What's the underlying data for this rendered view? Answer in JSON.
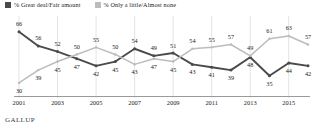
{
  "legend": {
    "items": [
      {
        "label": "% Great deal/Fair amount",
        "color": "#4a4a4a",
        "key": "great_deal"
      },
      {
        "label": "% Only a little/Almost none",
        "color": "#bcbcbc",
        "key": "only_a_little"
      }
    ]
  },
  "footer": {
    "brand": "GALLUP"
  },
  "chart_data": {
    "type": "line",
    "title": "",
    "subtitle": "",
    "xlabel": "",
    "ylabel": "",
    "ylim": [
      25,
      70
    ],
    "grid": true,
    "legend_position": "top-left",
    "x": [
      2001,
      2002,
      2003,
      2004,
      2005,
      2006,
      2007,
      2008,
      2009,
      2010,
      2011,
      2012,
      2013,
      2014,
      2015,
      2016
    ],
    "tick_labels": [
      "2001",
      "2003",
      "2005",
      "2007",
      "2009",
      "2011",
      "2013",
      "2015"
    ],
    "tick_years": [
      2001,
      2003,
      2005,
      2007,
      2009,
      2011,
      2013,
      2015
    ],
    "series": [
      {
        "name": "% Great deal/Fair amount",
        "color": "#4a4a4a",
        "values": [
          66,
          56,
          52,
          47,
          42,
          45,
          54,
          49,
          51,
          43,
          41,
          39,
          48,
          35,
          44,
          42
        ]
      },
      {
        "name": "% Only a little/Almost none",
        "color": "#bcbcbc",
        "values": [
          30,
          39,
          45,
          50,
          55,
          50,
          43,
          47,
          45,
          54,
          55,
          57,
          49,
          61,
          63,
          57
        ]
      }
    ]
  }
}
